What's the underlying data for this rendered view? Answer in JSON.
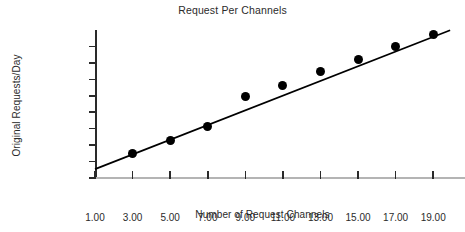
{
  "chart_data": {
    "type": "scatter",
    "title": "Request Per Channels",
    "xlabel": "Number of Request Channels",
    "ylabel": "Original Requests/Day",
    "grid": false,
    "legend": null,
    "xlim": [
      1,
      19
    ],
    "ylim": [
      0,
      4500000
    ],
    "x_tick_labels": [
      "1.00",
      "3.00",
      "5.00",
      "7.00",
      "9.00",
      "11.00",
      "13.00",
      "15.00",
      "17.00",
      "19.00"
    ],
    "x_tick_values": [
      1,
      3,
      5,
      7,
      9,
      11,
      13,
      15,
      17,
      19
    ],
    "y_tick_values": [
      0,
      500000,
      1000000,
      1500000,
      2000000,
      2500000,
      3000000,
      3500000,
      4000000
    ],
    "y_tick_labels": [
      "0",
      "500,000",
      "1,000,000",
      "1,500,000",
      "",
      "2,500,000",
      "3,000,000",
      "3,500,000",
      "4,000,000"
    ],
    "x": [
      3,
      5,
      7,
      9,
      11,
      13,
      15,
      17,
      19
    ],
    "values": [
      750000,
      1150000,
      1580000,
      2470000,
      2820000,
      3230000,
      3610000,
      4000000,
      4350000
    ],
    "series": [
      {
        "name": "Original Requests/Day",
        "x": [
          3,
          5,
          7,
          9,
          11,
          13,
          15,
          17,
          19
        ],
        "values": [
          750000,
          1150000,
          1580000,
          2470000,
          2820000,
          3230000,
          3610000,
          4000000,
          4350000
        ],
        "marker": "filled-circle",
        "color": "#000000"
      }
    ],
    "trendline": {
      "type": "linear",
      "x_start": 1,
      "x_end": 19.9,
      "y_start": 270000,
      "y_end": 4490000,
      "color": "#000000"
    },
    "colors": {
      "marker": "#000000",
      "line": "#000000",
      "axis": "#2a2a2a",
      "baseline": "#b4b4b4",
      "text": "#2b2b2b",
      "background": "#ffffff"
    }
  }
}
